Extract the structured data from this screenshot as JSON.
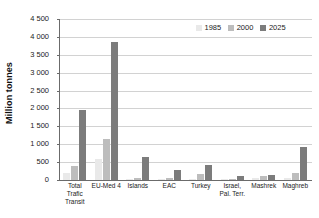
{
  "chart_data": {
    "type": "bar",
    "title": "",
    "xlabel": "",
    "ylabel": "Million tonnes",
    "ylim": [
      0,
      4500
    ],
    "ytick_step": 500,
    "grid": true,
    "legend_position": "top-right",
    "categories": [
      "Total Trafic Transit",
      "EU-Med 4",
      "Islands",
      "EAC",
      "Turkey",
      "Israel, Pal. Terr.",
      "Mashrek",
      "Maghreb"
    ],
    "category_lines": [
      [
        "Total",
        "Trafic",
        "Transit"
      ],
      [
        "EU-Med 4"
      ],
      [
        "Islands"
      ],
      [
        "EAC"
      ],
      [
        "Turkey"
      ],
      [
        "Israel,",
        "Pal. Terr."
      ],
      [
        "Mashrek"
      ],
      [
        "Maghreb"
      ]
    ],
    "ytick_labels": [
      "0",
      "500",
      "1 000",
      "1 500",
      "2 000",
      "2 500",
      "3 000",
      "3 500",
      "4 000",
      "4 500"
    ],
    "ytick_values": [
      0,
      500,
      1000,
      1500,
      2000,
      2500,
      3000,
      3500,
      4000,
      4500
    ],
    "series": [
      {
        "name": "1985",
        "color": "#e9e9e9",
        "values": [
          190,
          580,
          35,
          30,
          25,
          20,
          60,
          55
        ]
      },
      {
        "name": "2000",
        "color": "#bdbdbd",
        "values": [
          380,
          1150,
          50,
          45,
          155,
          40,
          120,
          195
        ]
      },
      {
        "name": "2025",
        "color": "#7c7c7c",
        "values": [
          1950,
          3850,
          640,
          275,
          415,
          100,
          140,
          930
        ]
      }
    ]
  },
  "legend": {
    "items": [
      {
        "label": "1985",
        "color": "#e9e9e9"
      },
      {
        "label": "2000",
        "color": "#bdbdbd"
      },
      {
        "label": "2025",
        "color": "#7c7c7c"
      }
    ]
  }
}
